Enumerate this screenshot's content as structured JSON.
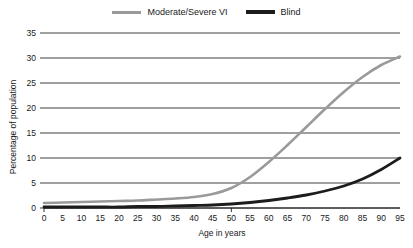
{
  "chart_data": {
    "type": "line",
    "title": "",
    "xlabel": "Age in years",
    "ylabel": "Percentage of population",
    "xlim": [
      0,
      95
    ],
    "ylim": [
      0,
      35
    ],
    "grid": true,
    "grid_axis": "y",
    "legend_position": "top-center",
    "x": [
      0,
      5,
      10,
      15,
      20,
      25,
      30,
      35,
      40,
      45,
      50,
      55,
      60,
      65,
      70,
      75,
      80,
      85,
      90,
      95
    ],
    "xticks": [
      "0",
      "5",
      "10",
      "15",
      "20",
      "25",
      "30",
      "35",
      "40",
      "45",
      "50",
      "55",
      "60",
      "65",
      "70",
      "75",
      "80",
      "85",
      "90",
      "95"
    ],
    "yticks": [
      "0",
      "5",
      "10",
      "15",
      "20",
      "25",
      "30",
      "35"
    ],
    "series": [
      {
        "name": "Moderate/Severe VI",
        "color": "#9a9a9a",
        "values": [
          1.0,
          1.1,
          1.2,
          1.3,
          1.4,
          1.5,
          1.7,
          1.9,
          2.2,
          2.8,
          4.0,
          6.2,
          9.2,
          12.6,
          16.2,
          19.8,
          23.2,
          26.2,
          28.6,
          30.3
        ]
      },
      {
        "name": "Blind",
        "color": "#1c1c1c",
        "values": [
          0.2,
          0.2,
          0.2,
          0.2,
          0.2,
          0.3,
          0.3,
          0.4,
          0.5,
          0.6,
          0.8,
          1.1,
          1.5,
          2.0,
          2.6,
          3.4,
          4.4,
          5.8,
          7.7,
          10.0
        ]
      }
    ]
  },
  "legend": {
    "entries": [
      {
        "label": "Moderate/Severe VI",
        "swatch": "gray-line-swatch"
      },
      {
        "label": "Blind",
        "swatch": "black-line-swatch"
      }
    ]
  },
  "axes": {
    "y_axis_title": "Percentage of population",
    "x_axis_title": "Age in years"
  }
}
